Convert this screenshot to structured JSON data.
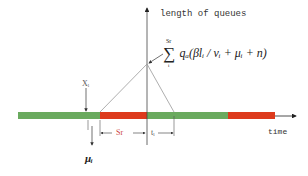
{
  "diagram": {
    "y_axis_label": "length of queues",
    "x_axis_label": "time",
    "formula": {
      "sum_symbol": "∑",
      "upper_limit": "Sr",
      "lower_limit": "i",
      "expression": "qₐ(βlᵢ / vᵢ + μᵢ + n)"
    },
    "labels": {
      "x_i": "Xᵢ",
      "s_r": "Sr",
      "t_i": "tᵢ",
      "mu_i": "μᵢ"
    },
    "signal_bar": {
      "segments": [
        {
          "color": "green",
          "hex": "#6aaa5e",
          "x_start": 18,
          "x_end": 100
        },
        {
          "color": "red",
          "hex": "#dd3a1c",
          "x_start": 100,
          "x_end": 147
        },
        {
          "color": "green",
          "hex": "#6aaa5e",
          "x_start": 147,
          "x_end": 228
        },
        {
          "color": "red",
          "hex": "#dd3a1c",
          "x_start": 228,
          "x_end": 275
        }
      ]
    },
    "colors": {
      "green": "#6aaa5e",
      "red": "#dd3a1c",
      "line": "#888888",
      "axis": "#333333"
    }
  }
}
